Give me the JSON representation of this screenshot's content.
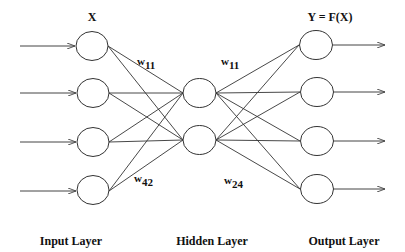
{
  "diagram": {
    "title_input": "X",
    "title_output": "Y = F(X)",
    "layers": {
      "input": "Input Layer",
      "hidden": "Hidden Layer",
      "output": "Output Layer"
    },
    "weights": [
      {
        "id": "w11-left",
        "base": "w",
        "sub": "11"
      },
      {
        "id": "w42",
        "base": "w",
        "sub": "42"
      },
      {
        "id": "w11-right",
        "base": "w",
        "sub": "11"
      },
      {
        "id": "w24",
        "base": "w",
        "sub": "24"
      }
    ],
    "nodes": {
      "input_count": 4,
      "hidden_count": 2,
      "output_count": 4
    },
    "colors": {
      "stroke": "#333333",
      "background": "#ffffff",
      "text": "#111111"
    }
  }
}
